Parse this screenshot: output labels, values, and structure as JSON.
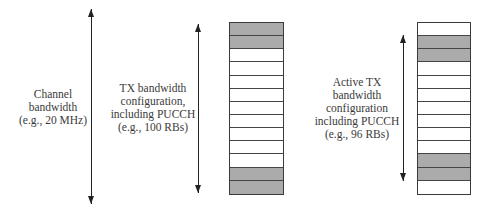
{
  "colors": {
    "shaded_rb": "#ababab",
    "empty_rb": "#ffffff",
    "line": "#222222",
    "text": "#3a3a3a"
  },
  "labels": {
    "channel_bandwidth": [
      "Channel",
      "bandwidth",
      "(e.g., 20 MHz)"
    ],
    "tx_bandwidth_config": [
      "TX bandwidth",
      "configuration,",
      "including PUCCH",
      "(e.g., 100 RBs)"
    ],
    "active_tx_bandwidth_config": [
      "Active TX",
      "bandwidth",
      "configuration",
      "including PUCCH",
      "(e.g., 96 RBs)"
    ]
  },
  "grids": {
    "tx_config_grid": {
      "rows": 13,
      "shaded_rows": [
        0,
        1,
        11,
        12
      ]
    },
    "active_tx_grid": {
      "rows": 13,
      "shaded_rows": [
        1,
        2,
        10,
        11
      ]
    }
  }
}
